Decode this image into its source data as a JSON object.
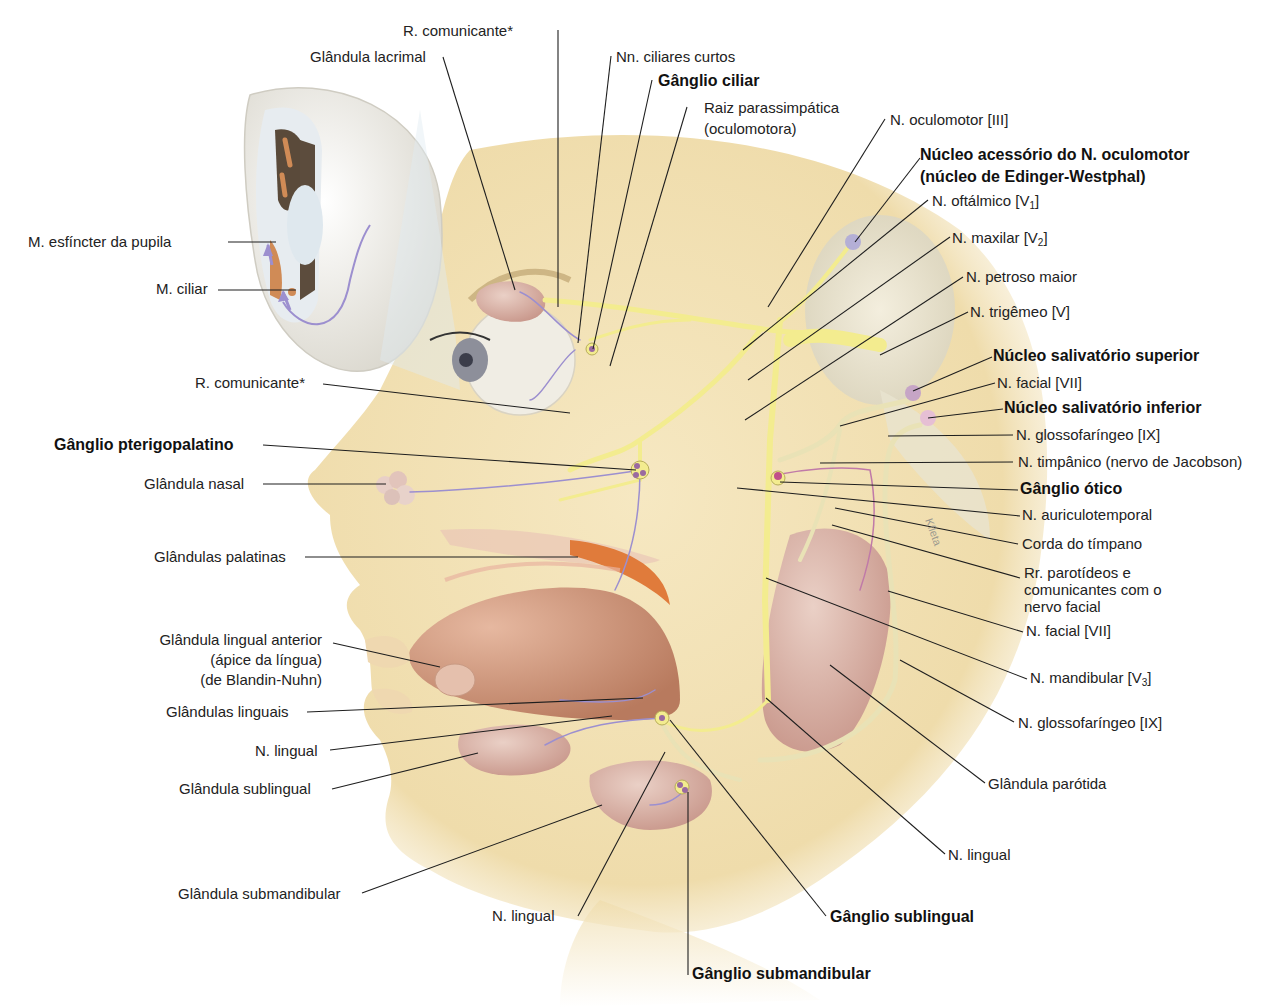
{
  "figure": {
    "colors": {
      "skin": "#f3e2b6",
      "skin_shadow": "#e2cc92",
      "nerve_yellow": "#f3ec8f",
      "nerve_outline": "#c9c26a",
      "gland_pink": "#d9b0a4",
      "gland_dark": "#c48f84",
      "fiber_purple": "#9c8fcf",
      "ganglion_purple": "#9a6aa0",
      "nucleus_pink": "#d7aac8",
      "tongue": "#c98f72",
      "palate_orange": "#e07b3b",
      "leader_line": "#1e1e1e",
      "eye_white": "#efefea"
    },
    "watermark": "Kfleta"
  },
  "labels": {
    "r_comunicante_top": "R. comunicante*",
    "glandula_lacrimal": "Glândula lacrimal",
    "nn_ciliares_curtos": "Nn. ciliares curtos",
    "ganglio_ciliar": "Gânglio ciliar",
    "raiz_parassimpatica_1": "Raiz parassimpática",
    "raiz_parassimpatica_2": "(oculomotora)",
    "n_oculomotor": "N. oculomotor [III]",
    "nucleo_acessorio_1": "Núcleo acessório do N. oculomotor",
    "nucleo_acessorio_2": "(núcleo de Edinger-Westphal)",
    "n_oftalmico": "N. oftálmico [V",
    "n_oftalmico_sub": "1",
    "n_maxilar": "N. maxilar [V",
    "n_maxilar_sub": "2",
    "n_petroso_maior": "N. petroso maior",
    "n_trigemeo": "N. trigêmeo [V]",
    "nucleo_salivatorio_superior": "Núcleo salivatório superior",
    "n_facial_top": "N. facial [VII]",
    "nucleo_salivatorio_inferior": "Núcleo salivatório inferior",
    "n_glossofaringeo_top": "N. glossofaríngeo [IX]",
    "n_timpanico": "N. timpânico (nervo de Jacobson)",
    "ganglio_otico": "Gânglio ótico",
    "n_auriculotemporal": "N. auriculotemporal",
    "corda_do_timpano": "Corda do tímpano",
    "rr_parotideos_1": "Rr. parotídeos e",
    "rr_parotideos_2": "comunicantes com o",
    "rr_parotideos_3": "nervo facial",
    "n_facial_bottom": "N. facial [VII]",
    "n_mandibular": "N. mandibular [V",
    "n_mandibular_sub": "3",
    "n_glossofaringeo_bottom": "N. glossofaríngeo [IX]",
    "glandula_parotida": "Glândula parótida",
    "n_lingual_right": "N. lingual",
    "ganglio_sublingual": "Gânglio sublingual",
    "ganglio_submandibular": "Gânglio submandibular",
    "n_lingual_bottom": "N. lingual",
    "glandula_submandibular": "Glândula submandibular",
    "glandula_sublingual": "Glândula sublingual",
    "n_lingual_left": "N. lingual",
    "glandulas_linguais": "Glândulas linguais",
    "glandula_lingual_anterior_1": "Glândula lingual anterior",
    "glandula_lingual_anterior_2": "(ápice da língua)",
    "glandula_lingual_anterior_3": "(de Blandin-Nuhn)",
    "glandulas_palatinas": "Glândulas palatinas",
    "glandula_nasal": "Glândula nasal",
    "ganglio_pterigopalatino": "Gânglio pterigopalatino",
    "r_comunicante_left": "R. comunicante*",
    "m_ciliar": "M. ciliar",
    "m_esfincter_pupila": "M. esfíncter da pupila"
  }
}
